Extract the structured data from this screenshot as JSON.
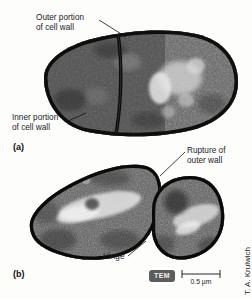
{
  "figure": {
    "type": "tem-micrograph",
    "background_color": "#fdfdfc",
    "ink_color": "#1c1c1c"
  },
  "annotations": [
    {
      "id": "outer-wall",
      "text": "Outer portion\nof cell wall"
    },
    {
      "id": "inner-wall",
      "text": "Inner portion\nof cell wall"
    },
    {
      "id": "rupture",
      "text": "Rupture of\nouter wall"
    },
    {
      "id": "hinge",
      "text": "Hinge"
    }
  ],
  "panels": [
    {
      "id": "a",
      "label": "(a)"
    },
    {
      "id": "b",
      "label": "(b)"
    }
  ],
  "scale": {
    "technique_badge": "TEM",
    "badge_color": "#5d5d5d",
    "bar_label": "0.5 µm"
  },
  "credit": {
    "text": "T. A. Krulwich"
  }
}
